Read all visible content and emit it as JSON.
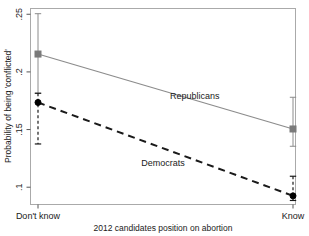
{
  "chart_data": {
    "type": "line",
    "title": "",
    "subtitle": "",
    "xlabel": "2012 candidates position on abortion",
    "ylabel": "Probability of being 'conflicted'",
    "categories": [
      "Don't know",
      "Know"
    ],
    "x_tick_labels": [
      "Don't know",
      "Know"
    ],
    "y_tick_labels": [
      ".25",
      ".2",
      ".15",
      ".1"
    ],
    "y_tick_values": [
      0.25,
      0.2,
      0.15,
      0.1
    ],
    "ylim": [
      0.085,
      0.255
    ],
    "xlim": [
      0,
      1
    ],
    "grid": false,
    "legend_position": "inline-annotation",
    "series": [
      {
        "name": "Republicans",
        "label": "Republicans",
        "line_style": "solid",
        "color": "#8c8c8c",
        "marker": "square",
        "marker_color": "#7a7a7a",
        "values": [
          0.2155,
          0.1505
        ],
        "ci_low": [
          0.1815,
          0.1355
        ],
        "ci_high": [
          0.2505,
          0.178
        ]
      },
      {
        "name": "Democrats",
        "label": "Democrats",
        "line_style": "dashed",
        "color": "#1a1a1a",
        "marker": "circle",
        "marker_color": "#000000",
        "values": [
          0.1735,
          0.0925
        ],
        "ci_low": [
          0.1375,
          0.0885
        ],
        "ci_high": [
          0.1815,
          0.1095
        ]
      }
    ],
    "annotations": [
      {
        "text": "Republicans",
        "x": 0.62,
        "y": 0.1765
      },
      {
        "text": "Democrats",
        "x": 0.5,
        "y": 0.1185
      }
    ]
  }
}
